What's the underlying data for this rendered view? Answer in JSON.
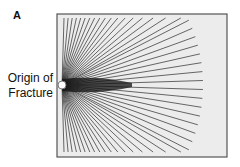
{
  "figure": {
    "panel_label": "A",
    "origin_label_line1": "Origin of",
    "origin_label_line2": "Fracture",
    "frame": {
      "x": 57,
      "y": 14,
      "width": 170,
      "height": 143,
      "fill": "#ececec",
      "stroke": "#555555"
    },
    "origin_point": {
      "x": 62,
      "y": 85,
      "r": 4,
      "fill": "#ffffff",
      "stroke": "#777777"
    },
    "rays": {
      "count": 52,
      "color": "#2a2a2a",
      "reach_right": 203,
      "reach_top": 18,
      "reach_bottom": 152
    }
  }
}
